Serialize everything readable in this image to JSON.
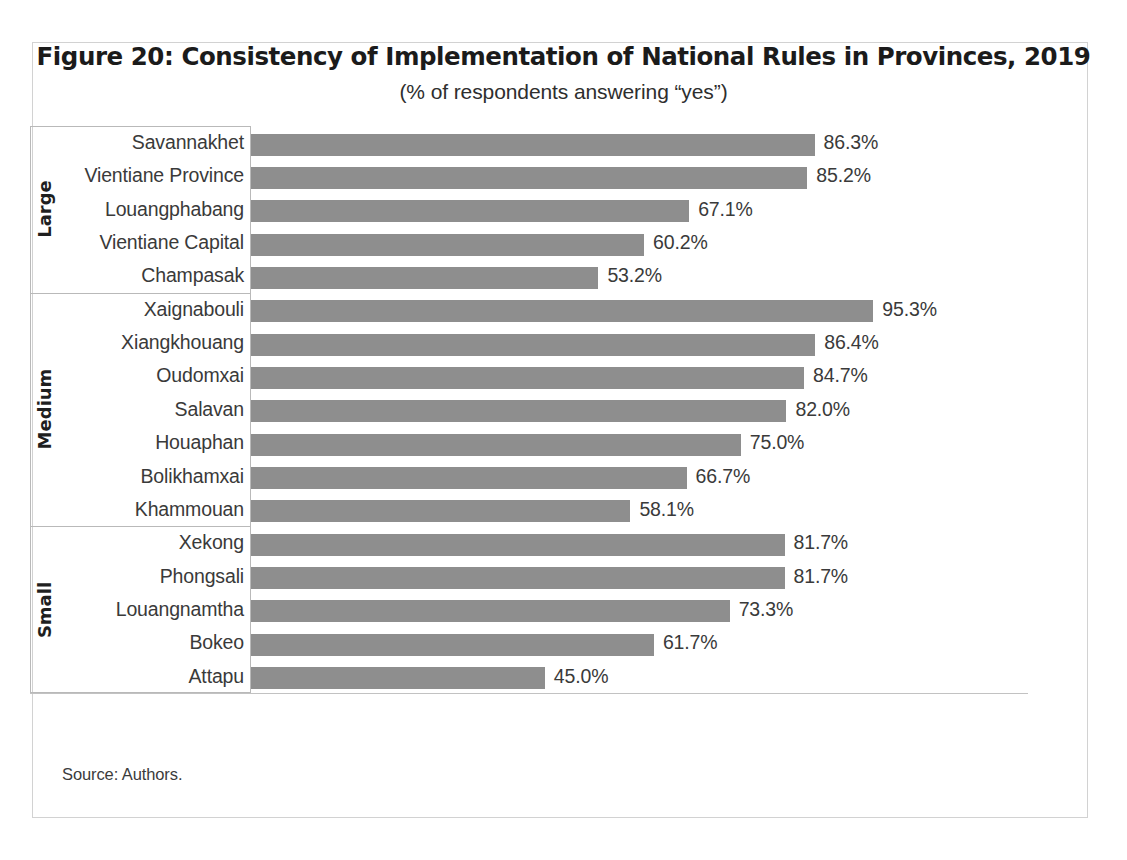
{
  "figure": {
    "title": "Figure 20: Consistency of Implementation of National Rules in Provinces, 2019",
    "subtitle": "(% of respondents answering “yes”)",
    "source": "Source: Authors."
  },
  "colors": {
    "bar": "#8e8e8e",
    "text": "#3a3a3a",
    "frame": "#d2d2d2",
    "divider": "#b9b9b9",
    "axis": "#c2c2c2"
  },
  "groups": [
    {
      "label": "Large",
      "count": 5
    },
    {
      "label": "Medium",
      "count": 7
    },
    {
      "label": "Small",
      "count": 5
    }
  ],
  "chart_data": {
    "type": "bar",
    "orientation": "horizontal",
    "title": "Figure 20: Consistency of Implementation of National Rules in Provinces, 2019",
    "subtitle": "(% of respondents answering “yes”)",
    "xlabel": "",
    "ylabel": "",
    "xlim": [
      0,
      100
    ],
    "grid": false,
    "legend": false,
    "value_suffix": "%",
    "categories": [
      "Savannakhet",
      "Vientiane Province",
      "Louangphabang",
      "Vientiane Capital",
      "Champasak",
      "Xaignabouli",
      "Xiangkhouang",
      "Oudomxai",
      "Salavan",
      "Houaphan",
      "Bolikhamxai",
      "Khammouan",
      "Xekong",
      "Phongsali",
      "Louangnamtha",
      "Bokeo",
      "Attapu"
    ],
    "values": [
      86.3,
      85.2,
      67.1,
      60.2,
      53.2,
      95.3,
      86.4,
      84.7,
      82.0,
      75.0,
      66.7,
      58.1,
      81.7,
      81.7,
      73.3,
      61.7,
      45.0
    ],
    "value_labels": [
      "86.3%",
      "85.2%",
      "67.1%",
      "60.2%",
      "53.2%",
      "95.3%",
      "86.4%",
      "84.7%",
      "82.0%",
      "75.0%",
      "66.7%",
      "58.1%",
      "81.7%",
      "81.7%",
      "73.3%",
      "61.7%",
      "45.0%"
    ],
    "group_of": [
      "Large",
      "Large",
      "Large",
      "Large",
      "Large",
      "Medium",
      "Medium",
      "Medium",
      "Medium",
      "Medium",
      "Medium",
      "Medium",
      "Small",
      "Small",
      "Small",
      "Small",
      "Small"
    ],
    "groups": [
      "Large",
      "Medium",
      "Small"
    ]
  }
}
